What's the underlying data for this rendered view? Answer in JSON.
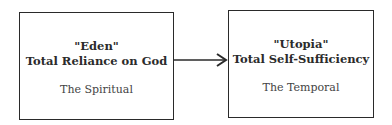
{
  "diagram": {
    "nodes": [
      {
        "quote": "\"Eden\"",
        "title": "Total Reliance on God",
        "subtitle": "The Spiritual"
      },
      {
        "quote": "\"Utopia\"",
        "title": "Total Self-Sufficiency",
        "subtitle": "The Temporal"
      }
    ],
    "edges": [
      {
        "from": 0,
        "to": 1,
        "style": "arrow"
      }
    ]
  }
}
